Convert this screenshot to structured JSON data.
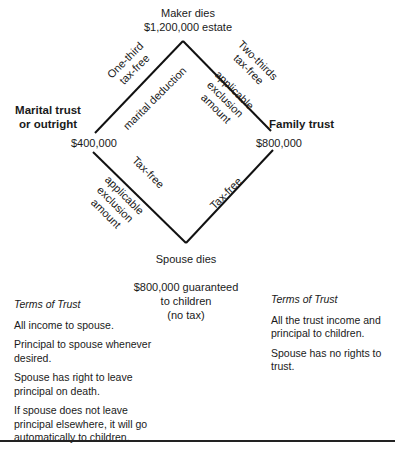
{
  "diagram": {
    "top": {
      "line1": "Maker dies",
      "line2": "$1,200,000 estate"
    },
    "left_node": {
      "title_line1": "Marital trust",
      "title_line2": "or outright",
      "amount": "$400,000"
    },
    "right_node": {
      "title": "Family trust",
      "amount": "$800,000"
    },
    "bottom": {
      "label": "Spouse dies",
      "note_line1": "$800,000 guaranteed",
      "note_line2": "to children",
      "note_line3": "(no tax)"
    },
    "edges": {
      "upper_left_outer": {
        "line1": "One-third",
        "line2": "tax-free"
      },
      "upper_left_inner": "marital deduction",
      "upper_right_outer": {
        "line1": "Two-thirds",
        "line2": "tax-free"
      },
      "upper_right_inner": {
        "line1": "applicable",
        "line2": "exclusion",
        "line3": "amount"
      },
      "lower_left_outer": {
        "line1": "applicable",
        "line2": "exclusion",
        "line3": "amount"
      },
      "lower_left_inner": "Tax-free",
      "lower_right_inner": "Tax-free"
    }
  },
  "terms_left": {
    "heading": "Terms of Trust",
    "items": [
      "All income to spouse.",
      "Principal to spouse whenever desired.",
      "Spouse has right to leave principal on death.",
      "If spouse does not leave principal elsewhere, it will go automatically to children."
    ]
  },
  "terms_right": {
    "heading": "Terms of Trust",
    "items": [
      "All the trust income and principal to children.",
      "Spouse has no rights to trust."
    ]
  },
  "colors": {
    "line": "#111111",
    "text": "#1a1a1a",
    "background": "#ffffff"
  }
}
